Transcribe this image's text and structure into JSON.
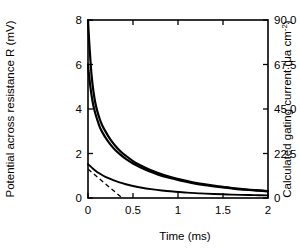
{
  "chart_data": {
    "type": "line",
    "title": "",
    "xlabel": "Time (ms)",
    "ylabel": "Potential across resistance R (mV)",
    "y2label": "Calculated gating current (μa cm⁻²)",
    "xlim": [
      0,
      2
    ],
    "ylim": [
      0,
      8
    ],
    "y2lim": [
      0,
      90.0
    ],
    "grid": false,
    "legend": "none",
    "xticks": [
      0,
      0.5,
      1,
      1.5,
      2
    ],
    "xticklabels": [
      "0",
      "0.5",
      "1",
      "1.5",
      "2"
    ],
    "yticks": [
      0,
      2,
      4,
      6,
      8
    ],
    "yticklabels": [
      "0",
      "2",
      "4",
      "6",
      "8"
    ],
    "y2ticks": [
      0,
      22.5,
      45.0,
      67.5,
      90.0
    ],
    "y2ticklabels": [
      "0",
      "22.5",
      "45.0",
      "67.5",
      "90.0"
    ],
    "series": [
      {
        "name": "upper-decay-curve",
        "style": "solid",
        "x": [
          0.0,
          0.012,
          0.025,
          0.04,
          0.06,
          0.08,
          0.1,
          0.13,
          0.16,
          0.2,
          0.25,
          0.3,
          0.36,
          0.42,
          0.5,
          0.58,
          0.68,
          0.78,
          0.9,
          1.02,
          1.15,
          1.3,
          1.45,
          1.6,
          1.75,
          1.9,
          2.0
        ],
        "y": [
          8.0,
          7.1,
          6.3,
          5.5,
          4.8,
          4.3,
          3.95,
          3.55,
          3.25,
          2.95,
          2.62,
          2.36,
          2.1,
          1.9,
          1.66,
          1.47,
          1.28,
          1.12,
          0.96,
          0.84,
          0.72,
          0.61,
          0.52,
          0.45,
          0.39,
          0.34,
          0.31
        ]
      },
      {
        "name": "middle-decay-curve",
        "style": "solid",
        "x": [
          0.0,
          0.012,
          0.025,
          0.04,
          0.06,
          0.08,
          0.1,
          0.13,
          0.16,
          0.2,
          0.25,
          0.3,
          0.36,
          0.42,
          0.5,
          0.58,
          0.68,
          0.78,
          0.9,
          1.02,
          1.15,
          1.3,
          1.45,
          1.6,
          1.75,
          1.9,
          2.0
        ],
        "y": [
          6.0,
          5.5,
          5.05,
          4.6,
          4.15,
          3.82,
          3.55,
          3.2,
          2.95,
          2.68,
          2.4,
          2.17,
          1.95,
          1.76,
          1.55,
          1.38,
          1.2,
          1.05,
          0.91,
          0.79,
          0.68,
          0.58,
          0.5,
          0.43,
          0.37,
          0.33,
          0.3
        ]
      },
      {
        "name": "lower-decay-curve",
        "style": "solid",
        "x": [
          0.0,
          0.02,
          0.05,
          0.08,
          0.12,
          0.17,
          0.22,
          0.28,
          0.35,
          0.42,
          0.5,
          0.6,
          0.7,
          0.82,
          0.95,
          1.1,
          1.25,
          1.4,
          1.55,
          1.7,
          1.85,
          2.0
        ],
        "y": [
          1.52,
          1.45,
          1.34,
          1.24,
          1.12,
          1.0,
          0.9,
          0.8,
          0.7,
          0.62,
          0.54,
          0.46,
          0.4,
          0.34,
          0.29,
          0.24,
          0.21,
          0.18,
          0.16,
          0.14,
          0.13,
          0.12
        ]
      },
      {
        "name": "dashed-tangent-line",
        "style": "dashed",
        "x": [
          0.0,
          0.38
        ],
        "y": [
          1.3,
          0.0
        ]
      }
    ]
  },
  "axes": {
    "left_title": "Potential across resistance R (mV)",
    "right_title_main": "Calculated gating current (",
    "right_title_unit": "μa cm",
    "right_title_exp": "-2",
    "right_title_close": ")",
    "bottom_title": "Time (ms)"
  }
}
